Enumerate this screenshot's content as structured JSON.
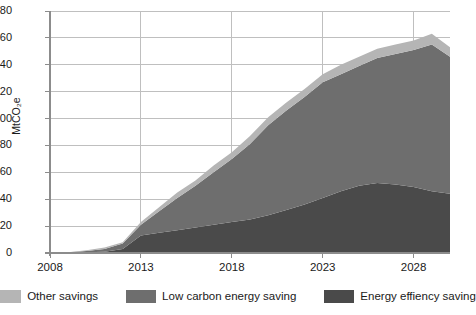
{
  "chart_data": {
    "type": "area",
    "stacked": true,
    "title": "",
    "xlabel": "",
    "ylabel": "MtCO2e",
    "ylabel_display": "MtCO₂e",
    "xlim": [
      2008,
      2030
    ],
    "ylim": [
      0,
      180
    ],
    "grid": true,
    "y_ticks": [
      0,
      20,
      40,
      60,
      80,
      100,
      120,
      140,
      160,
      180
    ],
    "x_ticks": [
      2008,
      2013,
      2018,
      2023,
      2028
    ],
    "x_tick_labels": [
      "2008",
      "2013",
      "2018",
      "2023",
      "2028"
    ],
    "legend_position": "bottom",
    "x": [
      2008,
      2009,
      2010,
      2011,
      2012,
      2013,
      2014,
      2015,
      2016,
      2017,
      2018,
      2019,
      2020,
      2021,
      2022,
      2023,
      2024,
      2025,
      2026,
      2027,
      2028,
      2029,
      2030
    ],
    "series": [
      {
        "name": "Energy effiency saving",
        "color": "#4a4a4a",
        "values": [
          0,
          0,
          0.5,
          1,
          3,
          13,
          15,
          17,
          19,
          21,
          23,
          25,
          28,
          32,
          36,
          41,
          46,
          50,
          52,
          51,
          49,
          46,
          44
        ]
      },
      {
        "name": "Low carbon energy saving",
        "color": "#6e6e6e",
        "values": [
          0,
          0.5,
          1,
          2,
          4,
          8,
          16,
          24,
          31,
          39,
          47,
          56,
          67,
          74,
          80,
          86,
          87,
          89,
          93,
          97,
          102,
          109,
          102
        ]
      },
      {
        "name": "Other savings",
        "color": "#b5b5b5",
        "values": [
          0,
          0,
          0.5,
          1,
          1,
          2,
          3,
          4,
          4,
          5,
          5,
          6,
          6,
          6,
          6,
          6,
          7,
          7,
          7,
          7,
          7,
          8,
          7
        ]
      }
    ],
    "totals": [
      0,
      0.5,
      2,
      4,
      8,
      23,
      34,
      45,
      54,
      65,
      75,
      87,
      101,
      112,
      122,
      133,
      140,
      146,
      152,
      155,
      158,
      163,
      153
    ]
  },
  "legend": {
    "items": [
      {
        "label": "Other savings",
        "color": "#b5b5b5"
      },
      {
        "label": "Low carbon energy saving",
        "color": "#6e6e6e"
      },
      {
        "label": "Energy effiency saving",
        "color": "#4a4a4a"
      }
    ]
  },
  "axes": {
    "y_label": "MtCO₂e",
    "y_tick_labels": [
      "180",
      "160",
      "140",
      "120",
      "100",
      "80",
      "60",
      "40",
      "20",
      "0"
    ],
    "x_tick_labels": [
      "2008",
      "2013",
      "2018",
      "2023",
      "2028"
    ]
  },
  "style": {
    "background": "#ffffff",
    "grid_color": "#bfbfbf",
    "axis_color": "#8c8c8c",
    "text_color": "#1a1a1a"
  }
}
